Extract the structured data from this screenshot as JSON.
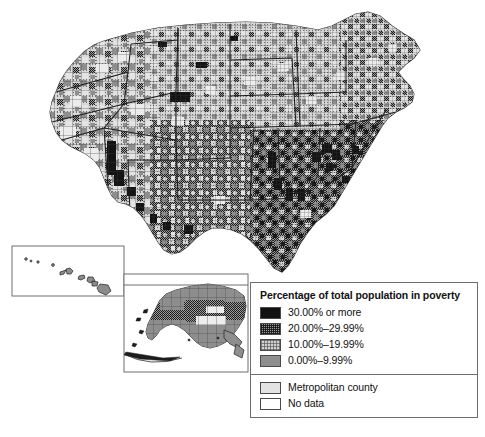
{
  "figure": {
    "kind": "choropleth-map",
    "background_color": "#ffffff",
    "outline_color": "#3a3a3a"
  },
  "legend": {
    "title": "Percentage of total population in poverty",
    "border_color": "#6e6e6e",
    "classes": [
      {
        "label": "30.00% or more",
        "swatch": "sw-black",
        "fill": "#111111",
        "pattern": "solid-black",
        "min": 30.0,
        "max": null
      },
      {
        "label": "20.00%–29.99%",
        "swatch": "sw-dense",
        "fill": "#9a9a9a",
        "pattern": "dense-cross-hatch",
        "min": 20.0,
        "max": 29.99
      },
      {
        "label": "10.00%–19.99%",
        "swatch": "sw-light",
        "fill": "#d2d2d2",
        "pattern": "light-cross-hatch",
        "min": 10.0,
        "max": 19.99
      },
      {
        "label": "0.00%–9.99%",
        "swatch": "sw-gray",
        "fill": "#8e8e8e",
        "pattern": "solid-gray",
        "min": 0.0,
        "max": 9.99
      }
    ],
    "extra": [
      {
        "label": "Metropolitan county",
        "swatch": "sw-metro",
        "fill": "#e2e2e2",
        "pattern": "solid-light-gray"
      },
      {
        "label": "No data",
        "swatch": "sw-nodata",
        "fill": "#ffffff",
        "pattern": "none"
      }
    ]
  },
  "insets": [
    {
      "name": "hawaii-inset",
      "border_color": "#6e6e6e"
    },
    {
      "name": "alaska-inset",
      "border_color": "#6e6e6e"
    }
  ]
}
